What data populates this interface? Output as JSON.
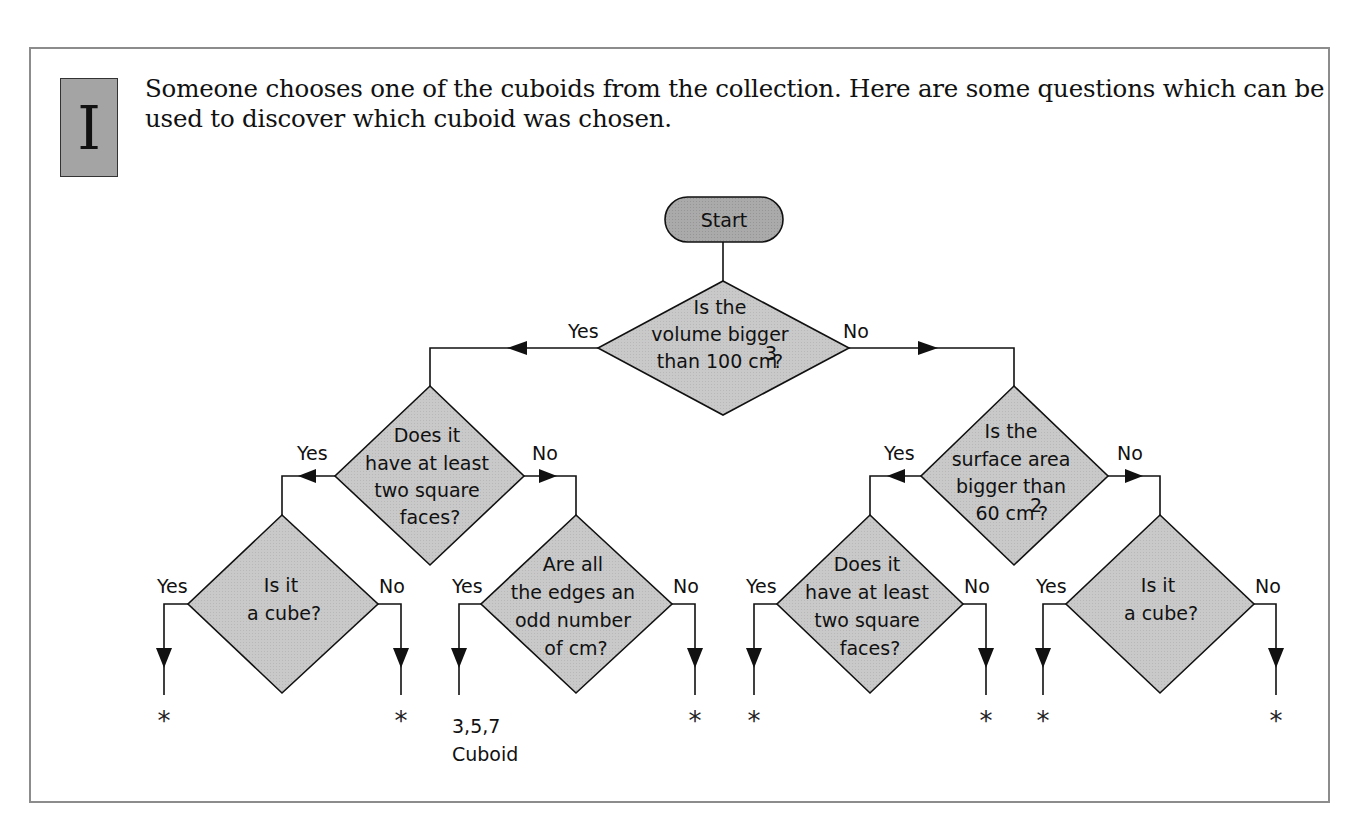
{
  "badge": {
    "letter": "I"
  },
  "intro": {
    "text": "Someone chooses one of the cuboids from the collection. Here are some questions which can be used to discover which cuboid was chosen."
  },
  "colors": {
    "frame_border": "#8c8c8c",
    "badge_fill": "#a4a4a4",
    "start_fill": "#a8a8a8",
    "decision_fill": "#c8c8c8",
    "line": "#111111"
  },
  "flowchart": {
    "start": {
      "label": "Start"
    },
    "root": {
      "lines": [
        "Is the",
        "volume bigger",
        "than 100 cm"
      ],
      "superscript": "3",
      "suffix": "?",
      "yes_label": "Yes",
      "no_label": "No"
    },
    "left": {
      "lines": [
        "Does it",
        "have at least",
        "two square",
        "faces?"
      ],
      "yes_label": "Yes",
      "no_label": "No"
    },
    "right": {
      "lines": [
        "Is the",
        "surface area",
        "bigger than",
        "60 cm"
      ],
      "superscript": "2",
      "suffix": "?",
      "yes_label": "Yes",
      "no_label": "No"
    },
    "leaves": [
      {
        "lines": [
          "Is it",
          "a cube?"
        ],
        "yes_label": "Yes",
        "no_label": "No",
        "yes_result": "*",
        "no_result": "*"
      },
      {
        "lines": [
          "Are all",
          "the edges an",
          "odd number",
          "of cm?"
        ],
        "yes_label": "Yes",
        "no_label": "No",
        "yes_result_line1": "3,5,7",
        "yes_result_line2": "Cuboid",
        "no_result": "*"
      },
      {
        "lines": [
          "Does it",
          "have at least",
          "two square",
          "faces?"
        ],
        "yes_label": "Yes",
        "no_label": "No",
        "yes_result": "*",
        "no_result": "*"
      },
      {
        "lines": [
          "Is it",
          "a cube?"
        ],
        "yes_label": "Yes",
        "no_label": "No",
        "yes_result": "*",
        "no_result": "*"
      }
    ]
  }
}
